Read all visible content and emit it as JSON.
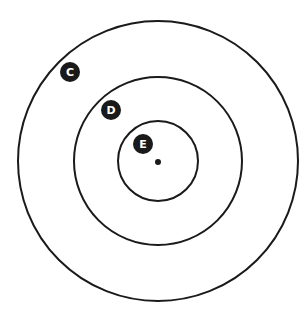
{
  "diagram": {
    "type": "concentric-circles",
    "center": {
      "x": 158,
      "y": 161
    },
    "center_dot": {
      "x": 158,
      "y": 162,
      "r": 3
    },
    "circles": [
      {
        "name": "outer",
        "r": 140
      },
      {
        "name": "middle",
        "r": 84
      },
      {
        "name": "inner",
        "r": 40
      }
    ],
    "stroke_color": "#1a1a1a",
    "badge_color": "#1a1a1a",
    "labels": [
      {
        "text": "C",
        "x": 70,
        "y": 72
      },
      {
        "text": "D",
        "x": 111,
        "y": 110
      },
      {
        "text": "E",
        "x": 143,
        "y": 144
      }
    ]
  }
}
